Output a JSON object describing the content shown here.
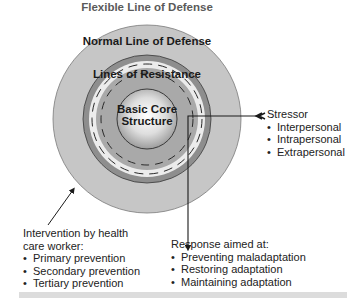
{
  "diagram": {
    "title": "Flexible Line of Defense",
    "rings": {
      "normal_line": "Normal Line of Defense",
      "lines_of_resistance": "Lines of Resistance",
      "core_line1": "Basic Core",
      "core_line2": "Structure"
    },
    "stressor": {
      "heading": "Stressor",
      "items": [
        "Interpersonal",
        "Intrapersonal",
        "Extrapersonal"
      ]
    },
    "intervention": {
      "heading_line1": "Intervention by health",
      "heading_line2": "care worker:",
      "items": [
        "Primary prevention",
        "Secondary prevention",
        "Tertiary prevention"
      ]
    },
    "response": {
      "heading": "Response aimed at:",
      "items": [
        "Preventing maladaptation",
        "Restoring adaptation",
        "Maintaining adaptation"
      ]
    },
    "colors": {
      "outer_ring": "#c6c6c6",
      "dark_ring": "#8e8e8e",
      "light_band": "#ececec",
      "inner_ring": "#a9a9a9",
      "core_center": "#ffffff",
      "core_edge": "#9a9a9a",
      "line": "#1a1a1a"
    }
  }
}
